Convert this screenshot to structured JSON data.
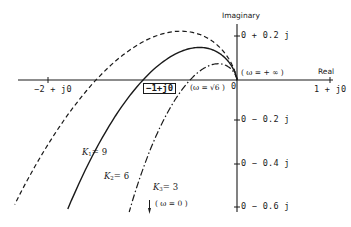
{
  "diagram": {
    "type": "nyquist-plot",
    "axes": {
      "real_label": "Real",
      "imag_label": "Imaginary",
      "origin_label": "0"
    },
    "real_ticks": [
      {
        "value": -2,
        "label": "−2 + j0"
      },
      {
        "value": -1,
        "label": "−1+j0",
        "boxed": true
      },
      {
        "value": 1,
        "label": "1 + j0"
      }
    ],
    "imag_ticks": [
      {
        "value": 0.2,
        "label": "0 + 0.2 j"
      },
      {
        "value": -0.2,
        "label": "0 − 0.2 j"
      },
      {
        "value": -0.4,
        "label": "0 − 0.4 j"
      },
      {
        "value": -0.6,
        "label": "0 − 0.6 j"
      }
    ],
    "annotations": {
      "omega_inf": "( ω = + ∞ )",
      "omega_sqrt6": "(ω = √6 )",
      "omega_zero": "( ω = 0 )"
    },
    "curves": [
      {
        "name": "K1",
        "gain_label": "K",
        "sub": "1",
        "value": "= 9",
        "style": "dashed",
        "real_crossing": -1.5,
        "peak_imag": 0.25
      },
      {
        "name": "K2",
        "gain_label": "K",
        "sub": "2",
        "value": "= 6",
        "style": "solid",
        "real_crossing": -1.0,
        "peak_imag": 0.17
      },
      {
        "name": "K3",
        "gain_label": "K",
        "sub": "3",
        "value": "= 3",
        "style": "dash-dot",
        "real_crossing": -0.5,
        "peak_imag": 0.085
      }
    ],
    "colors": {
      "ink": "#1a1a1a",
      "background": "#ffffff"
    }
  }
}
